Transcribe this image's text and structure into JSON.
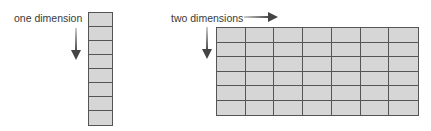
{
  "one_d": {
    "label": "one dimension",
    "rows": 8,
    "cols": 1,
    "arrow_direction": "down"
  },
  "two_d": {
    "label": "two dimensions",
    "rows": 6,
    "cols": 7,
    "arrow_directions": [
      "right",
      "down"
    ]
  },
  "colors": {
    "cell_fill": "#d6d6d6",
    "grid_line": "#555555",
    "arrow": "#444444",
    "text": "#3a3a3a"
  }
}
